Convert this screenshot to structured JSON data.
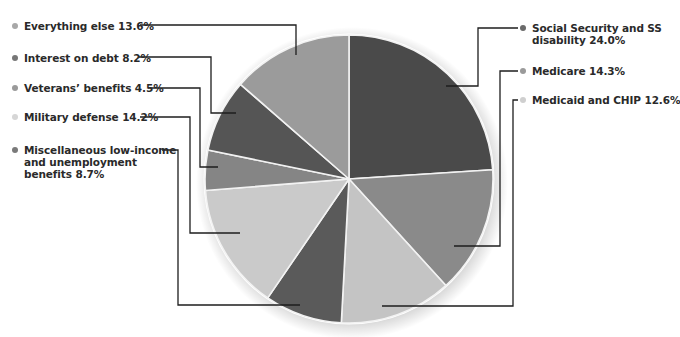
{
  "chart_data": {
    "type": "pie",
    "title": "",
    "start_angle_deg": 0,
    "direction": "clockwise",
    "unit": "%",
    "slices": [
      {
        "label": "Social Security and SS disability",
        "value": 24.0,
        "display": [
          "Social Security and SS",
          "disability 24.0%"
        ],
        "color": "#4a4a4a",
        "bullet": "#6a6a6a"
      },
      {
        "label": "Medicare",
        "value": 14.3,
        "display": [
          "Medicare 14.3%"
        ],
        "color": "#8a8a8a",
        "bullet": "#9a9a9a"
      },
      {
        "label": "Medicaid and CHIP",
        "value": 12.6,
        "display": [
          "Medicaid and CHIP 12.6%"
        ],
        "color": "#c4c4c4",
        "bullet": "#cfcfcf"
      },
      {
        "label": "Miscellaneous low-income and unemployment benefits",
        "value": 8.7,
        "display": [
          "Miscellaneous low-income",
          "and unemployment",
          "benefits 8.7%"
        ],
        "color": "#5a5a5a",
        "bullet": "#7a7a7a"
      },
      {
        "label": "Military defense",
        "value": 14.2,
        "display": [
          "Military defense 14.2%"
        ],
        "color": "#cacaca",
        "bullet": "#d6d6d6"
      },
      {
        "label": "Veterans' benefits",
        "value": 4.5,
        "display": [
          "Veterans’ benefits 4.5%"
        ],
        "color": "#858585",
        "bullet": "#9a9a9a"
      },
      {
        "label": "Interest on debt",
        "value": 8.2,
        "display": [
          "Interest on debt 8.2%"
        ],
        "color": "#555555",
        "bullet": "#777777"
      },
      {
        "label": "Everything else",
        "value": 13.6,
        "display": [
          "Everything else 13.6%"
        ],
        "color": "#9b9b9b",
        "bullet": "#a8a8a8"
      }
    ],
    "legend": "leader-line labels around pie"
  },
  "layout": {
    "center": [
      349,
      179
    ],
    "radius": 144,
    "labels": [
      {
        "x": 532,
        "y": 22,
        "line": [
          [
            518,
            28
          ],
          [
            478,
            28
          ],
          [
            478,
            86
          ],
          [
            446,
            86
          ]
        ]
      },
      {
        "x": 532,
        "y": 65,
        "line": [
          [
            518,
            71
          ],
          [
            500,
            71
          ],
          [
            500,
            246
          ],
          [
            454,
            246
          ]
        ]
      },
      {
        "x": 532,
        "y": 94,
        "line": [
          [
            518,
            100
          ],
          [
            513,
            100
          ],
          [
            513,
            306
          ],
          [
            382,
            306
          ]
        ]
      },
      {
        "x": 24,
        "y": 144,
        "line": [
          [
            162,
            150
          ],
          [
            178,
            150
          ],
          [
            178,
            305
          ],
          [
            300,
            305
          ]
        ]
      },
      {
        "x": 24,
        "y": 111,
        "line": [
          [
            140,
            117
          ],
          [
            190,
            117
          ],
          [
            190,
            233
          ],
          [
            240,
            233
          ]
        ]
      },
      {
        "x": 24,
        "y": 82,
        "line": [
          [
            148,
            88
          ],
          [
            200,
            88
          ],
          [
            200,
            167
          ],
          [
            218,
            167
          ]
        ]
      },
      {
        "x": 24,
        "y": 52,
        "line": [
          [
            138,
            57
          ],
          [
            211,
            57
          ],
          [
            211,
            113
          ],
          [
            236,
            113
          ]
        ]
      },
      {
        "x": 24,
        "y": 20,
        "line": [
          [
            140,
            25
          ],
          [
            296,
            25
          ],
          [
            296,
            55
          ]
        ]
      }
    ]
  }
}
